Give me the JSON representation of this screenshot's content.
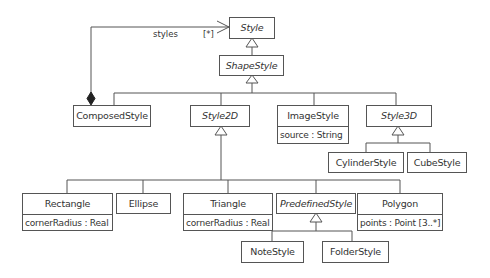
{
  "diagram": {
    "type": "UML class diagram",
    "classes": {
      "style": {
        "name": "Style",
        "abstract": true
      },
      "shape_style": {
        "name": "ShapeStyle",
        "abstract": true
      },
      "composed_style": {
        "name": "ComposedStyle",
        "abstract": false
      },
      "style2d": {
        "name": "Style2D",
        "abstract": true
      },
      "image_style": {
        "name": "ImageStyle",
        "abstract": false,
        "attributes": [
          "source : String"
        ]
      },
      "style3d": {
        "name": "Style3D",
        "abstract": true
      },
      "cylinder_style": {
        "name": "CylinderStyle",
        "abstract": false
      },
      "cube_style": {
        "name": "CubeStyle",
        "abstract": false
      },
      "rectangle": {
        "name": "Rectangle",
        "abstract": false,
        "attributes": [
          "cornerRadius : Real"
        ]
      },
      "ellipse": {
        "name": "Ellipse",
        "abstract": false
      },
      "triangle": {
        "name": "Triangle",
        "abstract": false,
        "attributes": [
          "cornerRadius : Real"
        ]
      },
      "predefined_style": {
        "name": "PredefinedStyle",
        "abstract": true
      },
      "polygon": {
        "name": "Polygon",
        "abstract": false,
        "attributes": [
          "points : Point [3..*]"
        ]
      },
      "note_style": {
        "name": "NoteStyle",
        "abstract": false
      },
      "folder_style": {
        "name": "FolderStyle",
        "abstract": false
      }
    },
    "associations": [
      {
        "from": "ComposedStyle",
        "to": "Style",
        "kind": "composition",
        "role": "styles",
        "multiplicity": "[*]"
      }
    ],
    "generalizations": [
      {
        "parent": "Style",
        "children": [
          "ShapeStyle"
        ]
      },
      {
        "parent": "ShapeStyle",
        "children": [
          "ComposedStyle",
          "Style2D",
          "ImageStyle",
          "Style3D"
        ]
      },
      {
        "parent": "Style3D",
        "children": [
          "CylinderStyle",
          "CubeStyle"
        ]
      },
      {
        "parent": "Style2D",
        "children": [
          "Rectangle",
          "Ellipse",
          "Triangle",
          "PredefinedStyle",
          "Polygon"
        ]
      },
      {
        "parent": "PredefinedStyle",
        "children": [
          "NoteStyle",
          "FolderStyle"
        ]
      }
    ],
    "labels": {
      "role": "styles",
      "multiplicity": "[*]"
    },
    "colors": {
      "line": "#555555",
      "text": "#333333",
      "background": "#ffffff"
    }
  }
}
